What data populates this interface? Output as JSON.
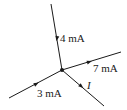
{
  "diagram": {
    "type": "circuit-node-kcl",
    "node": {
      "x": 62,
      "y": 70
    },
    "branches": [
      {
        "id": "top",
        "label": "4 mA",
        "direction": "into-node",
        "from": [
          51,
          4
        ],
        "to": [
          62,
          70
        ],
        "arrow": [
          57,
          38,
          100
        ],
        "label_pos": [
          60,
          42
        ]
      },
      {
        "id": "right",
        "label": "7 mA",
        "direction": "out-of-node",
        "from": [
          62,
          70
        ],
        "to": [
          121,
          52
        ],
        "arrow": [
          89,
          62,
          -17
        ],
        "label_pos": [
          93,
          72
        ]
      },
      {
        "id": "lower-left",
        "label": "3 mA",
        "direction": "into-node",
        "from": [
          9,
          98
        ],
        "to": [
          62,
          70
        ],
        "arrow": [
          36,
          84,
          -28
        ],
        "label_pos": [
          37,
          97
        ]
      },
      {
        "id": "lower-right",
        "label": "I",
        "direction": "out-of-node",
        "from": [
          62,
          70
        ],
        "to": [
          104,
          106
        ],
        "arrow": [
          81,
          86,
          40
        ],
        "label_pos": [
          87,
          89
        ]
      }
    ],
    "labels": {
      "top": "4 mA",
      "right": "7 mA",
      "lower_left": "3 mA",
      "lower_right": "I"
    },
    "colors": {
      "line": "#1a1a1a",
      "background": "#ffffff"
    }
  }
}
